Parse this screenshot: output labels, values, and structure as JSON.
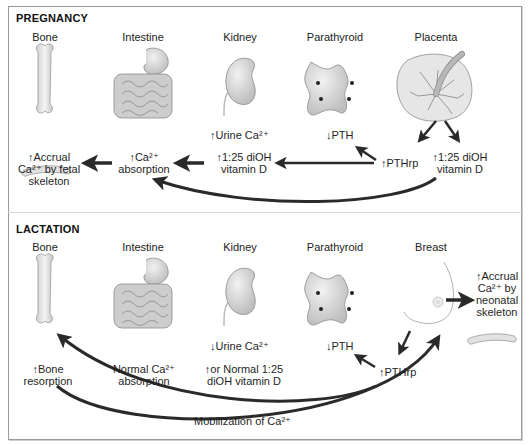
{
  "pregnancy": {
    "title": "PREGNANCY",
    "organs": [
      "Bone",
      "Intestine",
      "Kidney",
      "Parathyroid",
      "Placenta"
    ],
    "labels": {
      "urine": "↑Urine Ca²⁺",
      "pth": "↓PTH",
      "pthrp": "↑PTHrp",
      "vitd_kidney_1": "↑1:25 diOH",
      "vitd_kidney_2": "vitamin D",
      "vitd_placenta_1": "↑1:25 diOH",
      "vitd_placenta_2": "vitamin D",
      "absorption_1": "↑Ca²⁺",
      "absorption_2": "absorption",
      "accrual_1": "↑Accrual",
      "accrual_2": "Ca²⁺ by fetal",
      "accrual_3": "skeleton"
    }
  },
  "lactation": {
    "title": "LACTATION",
    "organs": [
      "Bone",
      "Intestine",
      "Kidney",
      "Parathyroid",
      "Breast"
    ],
    "labels": {
      "urine": "↓Urine Ca²⁺",
      "pth": "↓PTH",
      "pthrp": "↑PTHrp",
      "vitd_1": "↑or Normal 1:25",
      "vitd_2": "diOH vitamin D",
      "absorption_1": "Normal Ca²⁺",
      "absorption_2": "absorption",
      "resorption_1": "↑Bone",
      "resorption_2": "resorption",
      "accrual_1": "↑Accrual",
      "accrual_2": "Ca²⁺ by",
      "accrual_3": "neonatal",
      "accrual_4": "skeleton",
      "mobilization": "Mobilization of Ca²⁺"
    }
  },
  "colors": {
    "arrow": "#2a2a2a",
    "organ_fill": "#d8d8d8",
    "organ_stroke": "#8a8a8a",
    "frame": "#9a9a9a"
  }
}
